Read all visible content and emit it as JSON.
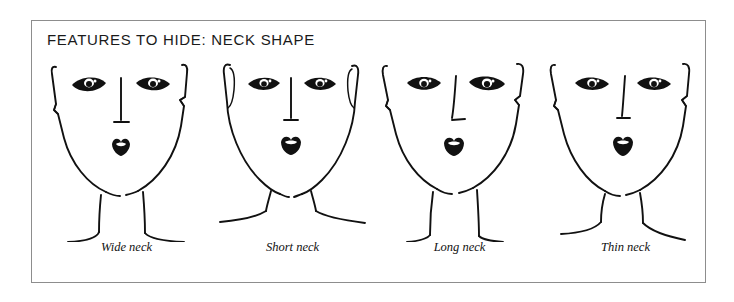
{
  "figure": {
    "title": "FEATURES TO HIDE: NECK SHAPE",
    "border_color": "#8d8d8d",
    "ink_color": "#111111",
    "background_color": "#ffffff"
  },
  "panels": [
    {
      "caption": "Wide neck",
      "neck_type": "wide",
      "face_shape": "oval",
      "ear_style": "notch",
      "features": [
        "left-eye",
        "right-eye",
        "nose",
        "mouth",
        "jawline",
        "neck",
        "shoulders"
      ]
    },
    {
      "caption": "Short neck",
      "neck_type": "short",
      "face_shape": "round",
      "ear_style": "loop",
      "features": [
        "left-eye",
        "right-eye",
        "nose",
        "mouth",
        "jawline",
        "neck",
        "shoulders"
      ]
    },
    {
      "caption": "Long neck",
      "neck_type": "long",
      "face_shape": "oval",
      "ear_style": "notch",
      "features": [
        "left-eye",
        "right-eye",
        "nose",
        "mouth",
        "jawline",
        "neck",
        "shoulders"
      ]
    },
    {
      "caption": "Thin neck",
      "neck_type": "thin",
      "face_shape": "oval",
      "ear_style": "notch",
      "features": [
        "left-eye",
        "right-eye",
        "nose",
        "mouth",
        "jawline",
        "neck",
        "shoulders"
      ]
    }
  ]
}
